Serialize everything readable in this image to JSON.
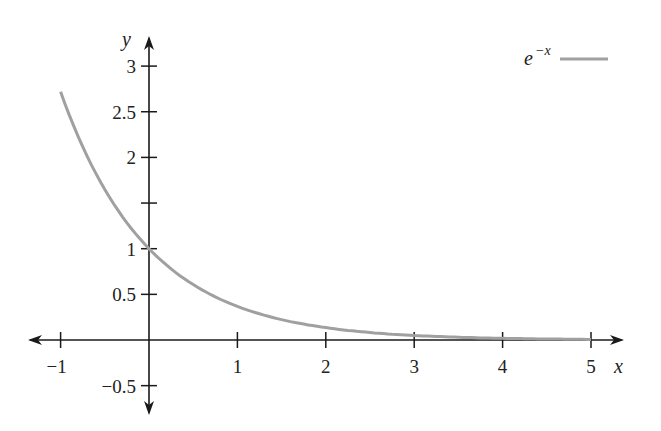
{
  "chart_data": {
    "type": "line",
    "title": "",
    "xlabel": "x",
    "ylabel": "y",
    "xlim": [
      -1,
      5
    ],
    "ylim": [
      -0.5,
      3
    ],
    "grid": false,
    "legend_position": "top-right",
    "x_ticks": [
      -1,
      1,
      2,
      3,
      4,
      5
    ],
    "x_tick_labels": [
      "−1",
      "1",
      "2",
      "3",
      "4",
      "5"
    ],
    "y_ticks": [
      3,
      2.5,
      2,
      1.5,
      1,
      0.5,
      -0.5
    ],
    "y_tick_labels": [
      "3",
      "2.5",
      "2",
      "",
      "1",
      "0.5",
      "−0.5"
    ],
    "series": [
      {
        "name": "e^{-x}",
        "function": "exp(-x)",
        "color": "#a0a0a0",
        "x": [
          -1,
          -0.5,
          0,
          0.5,
          1,
          1.5,
          2,
          2.5,
          3,
          3.5,
          4,
          4.5,
          5
        ],
        "values": [
          2.718,
          1.649,
          1.0,
          0.607,
          0.368,
          0.223,
          0.135,
          0.082,
          0.05,
          0.03,
          0.018,
          0.011,
          0.007
        ]
      }
    ],
    "legend": {
      "base": "e",
      "exponent": "−x"
    }
  }
}
